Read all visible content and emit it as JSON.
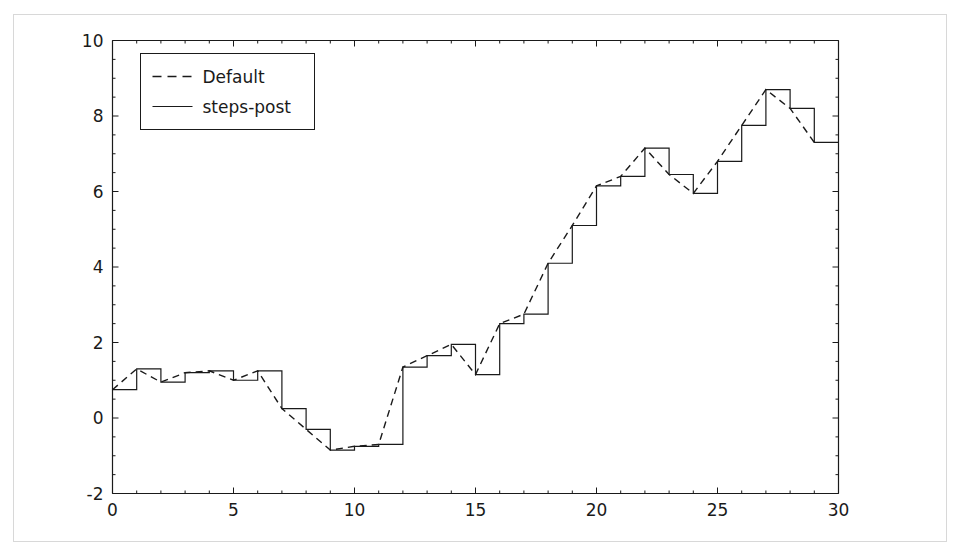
{
  "figure": {
    "title": "",
    "background_color": "#ffffff",
    "border_color": "#d8d8d8",
    "axes_color": "#1a1a1a",
    "line_color": "#1a1a1a"
  },
  "legend": {
    "position": "upper-left",
    "entries": [
      {
        "label": "Default",
        "style": "dashed",
        "sample_name": "legend-sample-dashed"
      },
      {
        "label": "steps-post",
        "style": "solid",
        "sample_name": "legend-sample-solid"
      }
    ]
  },
  "axes": {
    "x": {
      "label": "",
      "min": 0,
      "max": 30,
      "ticks": [
        0,
        5,
        10,
        15,
        20,
        25,
        30
      ],
      "tick_labels": [
        "0",
        "5",
        "10",
        "15",
        "20",
        "25",
        "30"
      ],
      "minor_tick_step": 1
    },
    "y": {
      "label": "",
      "min": -2,
      "max": 10,
      "ticks": [
        -2,
        0,
        2,
        4,
        6,
        8,
        10
      ],
      "tick_labels": [
        "-2",
        "0",
        "2",
        "4",
        "6",
        "8",
        "10"
      ],
      "minor_tick_step": 0.5
    },
    "grid": false
  },
  "chart_data": {
    "type": "line",
    "title": "",
    "xlabel": "",
    "ylabel": "",
    "xlim": [
      0,
      30
    ],
    "ylim": [
      -2,
      10
    ],
    "grid": false,
    "legend_position": "upper left",
    "x": [
      0,
      1,
      2,
      3,
      4,
      5,
      6,
      7,
      8,
      9,
      10,
      11,
      12,
      13,
      14,
      15,
      16,
      17,
      18,
      19,
      20,
      21,
      22,
      23,
      24,
      25,
      26,
      27,
      28,
      29
    ],
    "series": [
      {
        "name": "Default",
        "style": "dashed",
        "drawstyle": "default",
        "values": [
          0.75,
          1.3,
          0.95,
          1.2,
          1.25,
          1.0,
          1.25,
          0.25,
          -0.3,
          -0.85,
          -0.75,
          -0.7,
          1.35,
          1.65,
          1.95,
          1.15,
          2.5,
          2.75,
          4.1,
          5.1,
          6.15,
          6.4,
          7.15,
          6.45,
          5.95,
          6.8,
          7.75,
          8.7,
          8.2,
          7.3
        ]
      },
      {
        "name": "steps-post",
        "style": "solid",
        "drawstyle": "steps-post",
        "values": [
          0.75,
          1.3,
          0.95,
          1.2,
          1.25,
          1.0,
          1.25,
          0.25,
          -0.3,
          -0.85,
          -0.75,
          -0.7,
          1.35,
          1.65,
          1.95,
          1.15,
          2.5,
          2.75,
          4.1,
          5.1,
          6.15,
          6.4,
          7.15,
          6.45,
          5.95,
          6.8,
          7.75,
          8.7,
          8.2,
          7.3
        ]
      }
    ]
  }
}
